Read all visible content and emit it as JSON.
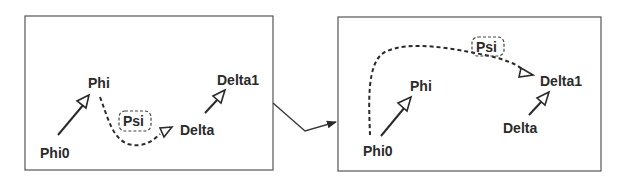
{
  "diagram": {
    "type": "graph-transformation",
    "before": {
      "nodes": {
        "phi0": "Phi0",
        "phi": "Phi",
        "psi": "Psi",
        "delta": "Delta",
        "delta1": "Delta1"
      },
      "edges": [
        {
          "from": "Phi0",
          "to": "Phi",
          "style": "solid"
        },
        {
          "from": "Delta",
          "to": "Delta1",
          "style": "solid"
        },
        {
          "from": "Phi",
          "to": "Delta",
          "style": "dashed",
          "label": "Psi"
        }
      ]
    },
    "after": {
      "nodes": {
        "phi0": "Phi0",
        "phi": "Phi",
        "psi": "Psi",
        "delta": "Delta",
        "delta1": "Delta1"
      },
      "edges": [
        {
          "from": "Phi0",
          "to": "Phi",
          "style": "solid"
        },
        {
          "from": "Delta",
          "to": "Delta1",
          "style": "solid"
        },
        {
          "from": "Phi0",
          "to": "Delta1",
          "style": "dashed",
          "label": "Psi"
        }
      ]
    },
    "transition": "before-to-after-arrow"
  }
}
